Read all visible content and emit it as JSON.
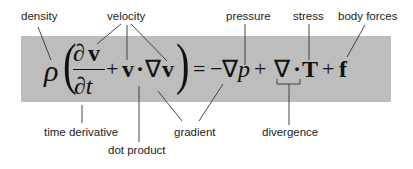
{
  "diagram": {
    "background_color": "#ffffff",
    "box_color": "#bdbdbd",
    "line_color": "#333333",
    "equation": {
      "rho": "ρ",
      "paren_open": "(",
      "partial_num": "∂v",
      "partial_num_partial": "∂",
      "partial_num_v": "v",
      "partial_den": "∂t",
      "plus1": "+",
      "v1": "v",
      "dot1": "·",
      "nabla1": "∇",
      "v2": "v",
      "paren_close": ")",
      "equals": "=",
      "minus": "−",
      "nabla2": "∇",
      "p": "p",
      "plus2": "+",
      "nabla3": "∇",
      "dot2": "·",
      "T": "T",
      "plus3": "+",
      "f": "f"
    },
    "labels": {
      "density": "density",
      "velocity": "velocity",
      "pressure": "pressure",
      "stress": "stress",
      "body_forces": "body forces",
      "time_derivative": "time derivative",
      "dot_product": "dot product",
      "gradient": "gradient",
      "divergence": "divergence"
    }
  }
}
